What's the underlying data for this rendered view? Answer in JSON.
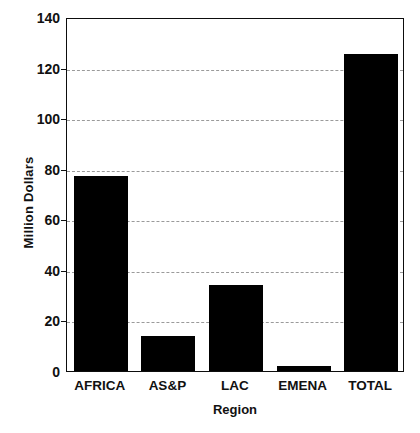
{
  "chart_data": {
    "type": "bar",
    "title": "",
    "subtitle": "",
    "categories": [
      "AFRICA",
      "AS&P",
      "LAC",
      "EMENA",
      "TOTAL"
    ],
    "values": [
      77,
      14,
      34,
      2,
      125.5
    ],
    "series": [
      {
        "name": "Million Dollars",
        "values": [
          77,
          14,
          34,
          2,
          125.5
        ]
      }
    ],
    "xlabel": "Region",
    "ylabel": "Million Dollars",
    "ylim": [
      0,
      140
    ],
    "yticks": [
      0,
      20,
      40,
      60,
      80,
      100,
      120,
      140
    ],
    "ytick_labels": [
      "0",
      "20",
      "40",
      "60",
      "80",
      "100",
      "120",
      "140"
    ],
    "grid": true,
    "grid_axis": "y",
    "grid_style": "dashed",
    "legend": false,
    "legend_position": "none",
    "bar_color": "#000000",
    "grid_color": "#9a9a9a",
    "axis_color": "#0d0d0d",
    "background_color": "#ffffff",
    "annotations": []
  }
}
